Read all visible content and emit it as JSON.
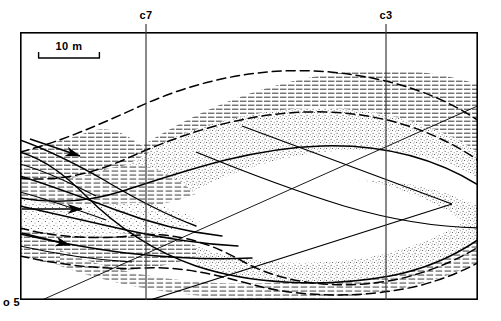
{
  "figure": {
    "type": "geological-cross-section",
    "background_color": "#ffffff",
    "ink_color": "#000000",
    "frame": {
      "x": 20,
      "y": 32,
      "width": 458,
      "height": 268,
      "stroke_width": 1.6
    }
  },
  "scale_bar": {
    "label": "10 m",
    "x": 38,
    "y": 52,
    "length": 62,
    "tick_height": 6
  },
  "core_lines": [
    {
      "id": "c7",
      "label": "c7",
      "x": 146,
      "label_x": 141,
      "label_y": 18,
      "y_top": 24,
      "y_bottom": 300
    },
    {
      "id": "c3",
      "label": "c3",
      "x": 386,
      "label_x": 381,
      "label_y": 18,
      "y_top": 24,
      "y_bottom": 300
    }
  ],
  "corner_label": {
    "text": "o 5",
    "x": 3,
    "y": 305
  },
  "legend_semantics": {
    "hatch_fill": "mud-silt-horizontal-lamination",
    "stipple_fill": "sand-stipple",
    "blank_fill": "unornamented-unit",
    "solid_line": "erosional-bounding-surface",
    "dashed_line": "inferred-bounding-surface"
  },
  "flow_arrows": [
    {
      "id": "arrow-upper",
      "x1": 30,
      "y1": 139,
      "x2": 78,
      "y2": 155,
      "label": "palaeoflow-upper"
    },
    {
      "id": "arrow-middle",
      "x1": 22,
      "y1": 209,
      "x2": 80,
      "y2": 209,
      "label": "palaeoflow-middle"
    },
    {
      "id": "arrow-lower",
      "x1": 22,
      "y1": 234,
      "x2": 68,
      "y2": 244,
      "label": "palaeoflow-lower"
    }
  ],
  "bounding_surfaces": [
    {
      "id": "s1",
      "style": "dashed",
      "note": "upper-major-sigmoid"
    },
    {
      "id": "s2",
      "style": "solid",
      "note": "central-erosional-base"
    },
    {
      "id": "s3",
      "style": "dashed",
      "note": "lower-inferred-base"
    },
    {
      "id": "s4",
      "style": "solid",
      "note": "left-downlap-set"
    },
    {
      "id": "s5",
      "style": "solid",
      "note": "right-chevron-clinoform"
    }
  ],
  "units": [
    {
      "id": "u1",
      "fill": "hatch",
      "position": "upper-right-arc"
    },
    {
      "id": "u2",
      "fill": "stipple",
      "position": "central-lens"
    },
    {
      "id": "u3",
      "fill": "hatch",
      "position": "left-upper-wedge"
    },
    {
      "id": "u4",
      "fill": "stipple",
      "position": "left-mid-wedge"
    },
    {
      "id": "u5",
      "fill": "hatch",
      "position": "left-lower-wedge"
    },
    {
      "id": "u6",
      "fill": "hatch",
      "position": "basal-right-band"
    },
    {
      "id": "u7",
      "fill": "stipple",
      "position": "right-lower-band"
    }
  ]
}
